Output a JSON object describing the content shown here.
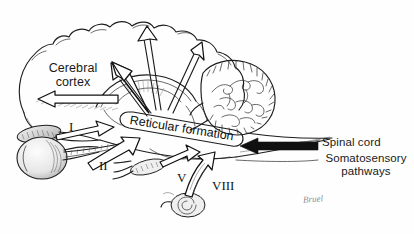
{
  "figure": {
    "type": "anatomical-diagram",
    "background_color": "#fefefe",
    "ink_color": "#1a1a1a"
  },
  "labels": {
    "cerebral_cortex": "Cerebral cortex",
    "reticular_formation": "Reticular formation",
    "spinal_cord": "Spinal cord",
    "somatosensory_pathways": "Somatosensory pathways"
  },
  "cranial_nerves": [
    {
      "numeral": "I",
      "name": "olfactory"
    },
    {
      "numeral": "II",
      "name": "optic"
    },
    {
      "numeral": "V",
      "name": "trigeminal"
    },
    {
      "numeral": "VIII",
      "name": "vestibulocochlear"
    }
  ],
  "signature": "Bruel",
  "structures": [
    "cerebral-hemisphere",
    "cerebellum",
    "brainstem",
    "eyeball",
    "olfactory-bulb",
    "cochlea",
    "reticular-formation-capsule"
  ],
  "arrows": {
    "ascending_outlined": 3,
    "cortex_outlined": 1,
    "afferent_inputs": 4,
    "spinal_input_solid": 1
  }
}
